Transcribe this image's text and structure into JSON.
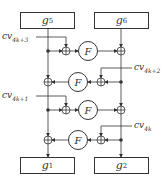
{
  "boxes": {
    "g5": {
      "base": "g",
      "sub": "5"
    },
    "g6": {
      "base": "g",
      "sub": "6"
    },
    "g1": {
      "base": "g",
      "sub": "1"
    },
    "g2": {
      "base": "g",
      "sub": "2"
    }
  },
  "round_keys": [
    {
      "base": "cv",
      "sub": "4k+3"
    },
    {
      "base": "cv",
      "sub": "4k+2"
    },
    {
      "base": "cv",
      "sub": "4k+1"
    },
    {
      "base": "cv",
      "sub": "4k"
    }
  ],
  "function_label": "F",
  "colors": {
    "line": "#333333",
    "background": "#ffffff"
  }
}
